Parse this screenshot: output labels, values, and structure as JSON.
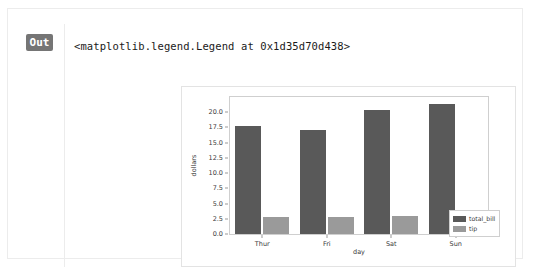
{
  "cell": {
    "prompt_label": "Out",
    "repr_text": "<matplotlib.legend.Legend at 0x1d35d70d438>"
  },
  "colors": {
    "total_bill": "#595959",
    "tip": "#9a9a9a",
    "axes_edge": "#cfcfcf",
    "figure_edge": "#e3e3e3",
    "tick_text": "#3b3b3b",
    "out_badge_bg": "#757575"
  },
  "chart_data": {
    "type": "bar",
    "title": "",
    "xlabel": "day",
    "ylabel": "dollars",
    "categories": [
      "Thur",
      "Fri",
      "Sat",
      "Sun"
    ],
    "series": [
      {
        "name": "total_bill",
        "color": "#595959",
        "values": [
          17.68,
          17.15,
          20.44,
          21.41
        ]
      },
      {
        "name": "tip",
        "color": "#9a9a9a",
        "values": [
          2.77,
          2.73,
          2.99,
          3.26
        ]
      }
    ],
    "ylim": [
      0.0,
      22.5
    ],
    "yticks": [
      0.0,
      2.5,
      5.0,
      7.5,
      10.0,
      12.5,
      15.0,
      17.5,
      20.0
    ],
    "ytick_labels": [
      "0.0",
      "2.5",
      "5.0",
      "7.5",
      "10.0",
      "12.5",
      "15.0",
      "17.5",
      "20.0"
    ],
    "grid": false,
    "legend_position": "center right (outside axes)",
    "legend_entries": [
      "total_bill",
      "tip"
    ]
  }
}
